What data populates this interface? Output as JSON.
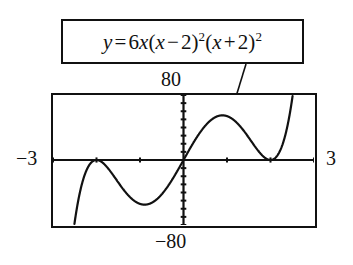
{
  "figure": {
    "kind": "graphing-calculator-screen",
    "equation": {
      "lhs": "y",
      "equals": "=",
      "coefficient": "6",
      "variable": "x",
      "factor1_open": "(",
      "factor1_var": "x",
      "factor1_op": "−",
      "factor1_const": "2",
      "factor1_close": ")",
      "factor1_exp": "2",
      "factor2_open": "(",
      "factor2_var": "x",
      "factor2_op": "+",
      "factor2_const": "2",
      "factor2_close": ")",
      "factor2_exp": "2",
      "plain": "y = 6x(x − 2)²(x + 2)²"
    },
    "window": {
      "ymax_label": "80",
      "ymin_label": "−80",
      "xmin_label": "−3",
      "xmax_label": "3"
    }
  },
  "chart_data": {
    "type": "line",
    "xlabel": "",
    "ylabel": "",
    "xlim": [
      -3,
      3
    ],
    "ylim": [
      -80,
      80
    ],
    "grid": false,
    "legend": "none",
    "axes": {
      "x_axis_at_y": 0,
      "y_axis_at_x": 0,
      "x_tick_spacing": 1,
      "y_tick_spacing": 10,
      "tick_style": "hash-marks-on-axes"
    },
    "function": {
      "expression": "6*x*(x-2)^2*(x+2)^2",
      "expanded": "6x^5 - 48x^3 + 96x",
      "degree": 5
    },
    "roots": [
      {
        "x": -2,
        "multiplicity": 2,
        "behavior": "tangent"
      },
      {
        "x": 0,
        "multiplicity": 1,
        "behavior": "crossing"
      },
      {
        "x": 2,
        "multiplicity": 2,
        "behavior": "tangent"
      }
    ],
    "critical_points": [
      {
        "x": -2,
        "y": 0,
        "type": "local-maximum"
      },
      {
        "x": -1.265,
        "y": -66.5,
        "type": "local-minimum"
      },
      {
        "x": 1.265,
        "y": 66.5,
        "type": "local-maximum"
      },
      {
        "x": 2,
        "y": 0,
        "type": "local-minimum"
      }
    ],
    "series": [
      {
        "name": "y = 6x(x − 2)²(x + 2)²",
        "x": [
          -3,
          -2.8,
          -2.6,
          -2.4,
          -2.2,
          -2,
          -1.8,
          -1.6,
          -1.4,
          -1.2,
          -1,
          -0.8,
          -0.6,
          -0.4,
          -0.2,
          0,
          0.2,
          0.4,
          0.6,
          0.8,
          1,
          1.2,
          1.4,
          1.6,
          1.8,
          2,
          2.2,
          2.4,
          2.6,
          2.8,
          3
        ],
        "values": [
          -450,
          -290.6,
          -177.1,
          -99.5,
          -49.9,
          0,
          34.6,
          55.3,
          65.1,
          66.9,
          63,
          55.2,
          44.5,
          31.2,
          16.2,
          0,
          -16.2,
          -31.2,
          -44.5,
          -55.2,
          -63,
          -66.9,
          -65.1,
          -55.3,
          -34.6,
          0,
          49.9,
          99.5,
          177.1,
          290.6,
          450
        ]
      }
    ],
    "note": "Curve drawn is y = 6x(x-2)^2(x+2)^2 reflected in sign convention of display; screen shows rising-to-the-right quintic with double roots at x=-2 and x=2 and a simple root at x=0."
  }
}
